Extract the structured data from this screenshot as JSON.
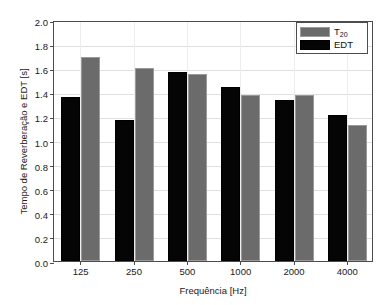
{
  "chart_data": {
    "type": "bar",
    "title": "",
    "xlabel": "Frequência [Hz]",
    "ylabel": "Tempo de Reverberação e EDT [s]",
    "categories": [
      "125",
      "250",
      "500",
      "1000",
      "2000",
      "4000"
    ],
    "series": [
      {
        "name": "EDT",
        "values": [
          1.36,
          1.17,
          1.57,
          1.44,
          1.34,
          1.21
        ],
        "color": "#050505"
      },
      {
        "name": "T20",
        "values": [
          1.69,
          1.6,
          1.55,
          1.38,
          1.38,
          1.13
        ],
        "color": "#6b6b6b"
      }
    ],
    "ylim": [
      0.0,
      2.0
    ],
    "yticks": [
      "0.0",
      "0.2",
      "0.4",
      "0.6",
      "0.8",
      "1.0",
      "1.2",
      "1.4",
      "1.6",
      "1.8",
      "2.0"
    ],
    "ytick_values": [
      0.0,
      0.2,
      0.4,
      0.6,
      0.8,
      1.0,
      1.2,
      1.4,
      1.6,
      1.8,
      2.0
    ],
    "grid": true,
    "legend_position": "top-right"
  },
  "legend": {
    "entries": [
      {
        "label_main": "T",
        "label_sub": "20",
        "series": "T20"
      },
      {
        "label_main": "EDT",
        "label_sub": "",
        "series": "EDT"
      }
    ]
  }
}
